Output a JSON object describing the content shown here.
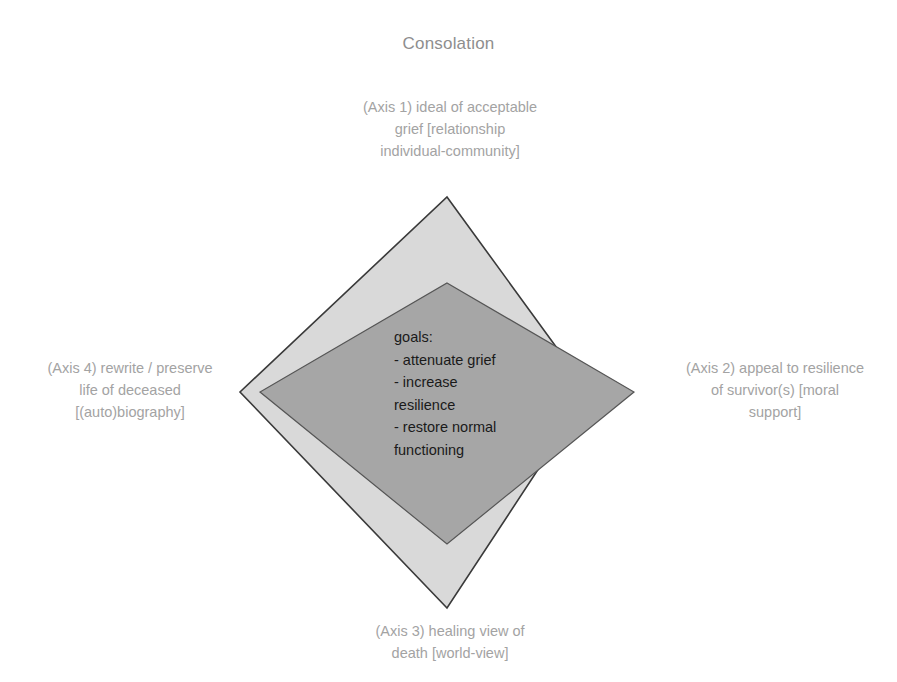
{
  "chart_data": {
    "type": "radar",
    "title": "Consolation",
    "axes": [
      "(Axis 1) ideal of acceptable grief [relationship individual-community]",
      "(Axis 2) appeal to resilience of survivor(s) [moral support]",
      "(Axis 3) healing view of death [world-view]",
      "(Axis 4) rewrite / preserve life of deceased [(auto)biography]"
    ],
    "series": [
      {
        "name": "outer",
        "fill": "#d9d9d9",
        "values": [
          195,
          142,
          216,
          207
        ]
      },
      {
        "name": "inner",
        "fill": "#a6a6a6",
        "values": [
          109,
          187,
          152,
          187
        ]
      }
    ],
    "center": [
      447,
      392
    ],
    "grid": false,
    "legend": "none",
    "annotation": "goals:\n- attenuate grief\n- increase\nresilience\n- restore normal\nfunctioning"
  },
  "title": "Consolation",
  "axes": {
    "axis1": "(Axis 1) ideal of acceptable\ngrief [relationship\nindividual-community]",
    "axis2": "(Axis 2) appeal to resilience\nof survivor(s) [moral\nsupport]",
    "axis3": "(Axis 3) healing view of\ndeath [world-view]",
    "axis4": "(Axis 4) rewrite / preserve\nlife of deceased\n[(auto)biography]"
  },
  "goals": {
    "text": "goals:\n- attenuate grief\n- increase\nresilience\n- restore normal\nfunctioning"
  },
  "colors": {
    "outer_fill": "#d9d9d9",
    "inner_fill": "#a6a6a6",
    "stroke": "#3a3a3a",
    "label": "#a3a3a3",
    "title": "#8e8e8e"
  }
}
